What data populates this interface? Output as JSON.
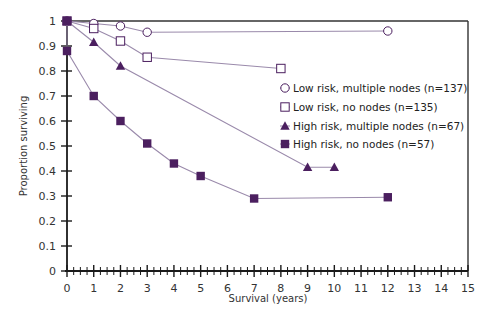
{
  "chart_data": {
    "type": "line",
    "title": "",
    "xlabel": "Survival (years)",
    "ylabel": "Proportion surviving",
    "xlim": [
      0,
      15
    ],
    "ylim": [
      0,
      1
    ],
    "x_ticks": [
      "0",
      "1",
      "2",
      "3",
      "4",
      "5",
      "6",
      "7",
      "8",
      "9",
      "10",
      "11",
      "12",
      "13",
      "14",
      "15"
    ],
    "y_ticks": [
      "0",
      "0.1",
      "0.2",
      "0.3",
      "0.4",
      "0.5",
      "0.6",
      "0.7",
      "0.8",
      "0.9",
      "1"
    ],
    "grid": false,
    "legend_position": "right-inside",
    "colors": {
      "marker": "#4b1f5f",
      "line": "#9a8aab",
      "axis": "#1a1a1a"
    },
    "series": [
      {
        "name": "Low risk, multiple nodes (n=137)",
        "marker": "open-circle",
        "x": [
          0,
          1,
          2,
          3,
          12
        ],
        "y": [
          1.0,
          0.99,
          0.98,
          0.955,
          0.96
        ]
      },
      {
        "name": "Low risk, no nodes (n=135)",
        "marker": "open-square",
        "x": [
          0,
          1,
          2,
          3,
          8
        ],
        "y": [
          1.0,
          0.97,
          0.92,
          0.855,
          0.81
        ]
      },
      {
        "name": "High risk, multiple nodes (n=67)",
        "marker": "filled-triangle",
        "x": [
          0,
          1,
          2,
          9,
          10
        ],
        "y": [
          1.0,
          0.915,
          0.82,
          0.415,
          0.415
        ]
      },
      {
        "name": "High risk, no nodes (n=57)",
        "marker": "filled-square",
        "x": [
          0,
          0,
          1,
          2,
          3,
          4,
          5,
          7,
          12
        ],
        "y": [
          1.0,
          0.88,
          0.7,
          0.6,
          0.51,
          0.43,
          0.38,
          0.29,
          0.295
        ]
      }
    ]
  }
}
